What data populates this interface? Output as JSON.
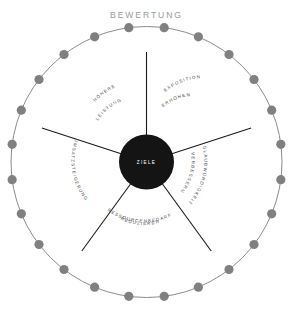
{
  "chart_data": {
    "type": "pie",
    "title": "BEWERTUNG",
    "subtitle": "",
    "xlabel": "",
    "ylabel": "",
    "center_label": "ZIELE",
    "legend_position": "none",
    "grid": false,
    "categories": [
      "EXPOSITION ERHÖHEN",
      "GLAUBWÜRDIGKEIT VERBESSERN",
      "RESSOURCENBEDARF REDUZIEREN",
      "UMSATZSTEIGERUNG",
      "HÖHERE LEISTUNG"
    ],
    "values": [
      20,
      20,
      20,
      20,
      20
    ],
    "units": "percent",
    "annotations": [
      "5 equal segments of a doughnut wheel",
      "24 gray marker dots spaced evenly along the outer ring"
    ],
    "marker_dot_count": 24,
    "colors": {
      "hub": "#141414",
      "hub_text": "#ffffff",
      "spoke": "#1a1a1a",
      "ring": "#8c8c8c",
      "dot": "#808080",
      "title": "#9a9a9a",
      "label": "#4d4d4d",
      "background": "#ffffff"
    }
  },
  "diagram": {
    "title": "BEWERTUNG",
    "center": {
      "label": "ZIELE"
    },
    "segments": [
      {
        "id": "exposition",
        "line1": "EXPOSITION",
        "line2": "ERHÖHEN"
      },
      {
        "id": "glaubwuerdigkeit",
        "line1": "GLAUBWÜRDIGKEIT",
        "line2": "VERBESSERN"
      },
      {
        "id": "ressourcenbedarf",
        "line1": "RESSOURCENBEDARF",
        "line2": "REDUZIEREN"
      },
      {
        "id": "umsatz",
        "line1": "UMSATZSTEIGERUNG",
        "line2": ""
      },
      {
        "id": "leistung",
        "line1": "HÖHERE",
        "line2": "LEISTUNG"
      }
    ]
  }
}
